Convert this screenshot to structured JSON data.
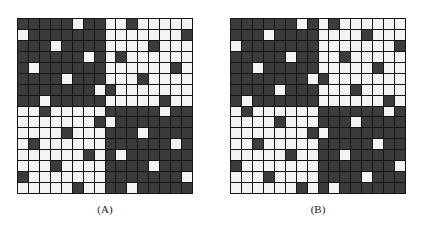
{
  "figure": {
    "colors": {
      "dark": "#3b3b3b",
      "light": "#f3f3f3",
      "grid_line": "#151515"
    },
    "grid_size": 16,
    "panels": [
      {
        "label": "(A)",
        "description": "16x16 grid; quadrant checkerboard (TL dark, TR light, BL light, BR dark) with one inverted cell per row in each quadrant",
        "rows": [
          "1111101100100000",
          "0111111100000001",
          "1110111100001000",
          "1111110101000000",
          "1011111100000010",
          "1111011100010000",
          "1111111010000000",
          "1101111100000100",
          "0010000011111011",
          "0000000101111111",
          "0000100011101111",
          "0100000011111101",
          "0000001010111111",
          "0001000011110111",
          "1000000011111110",
          "0000010011011111"
        ]
      },
      {
        "label": "(B)",
        "description": "16x16 grid; quadrant checkerboard (TL dark, TR light, BL light, BR dark) with one inverted cell per row in each quadrant",
        "rows": [
          "1111110101000000",
          "1110111100001000",
          "0111111100000001",
          "1111101100100000",
          "1101111100000100",
          "1111111010000000",
          "1111011100010000",
          "1011111100000010",
          "0100000011111101",
          "0000100011101111",
          "0000000101111111",
          "0010000011111011",
          "0000010011011111",
          "1000000011111110",
          "0001000011110111",
          "0000001010111111"
        ]
      }
    ]
  }
}
